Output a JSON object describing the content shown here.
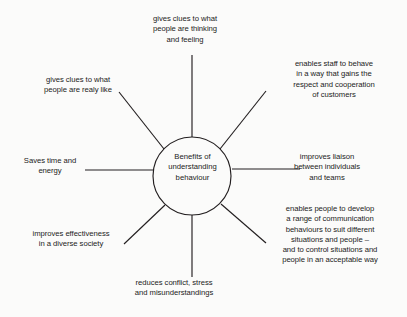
{
  "diagram": {
    "type": "mind-map",
    "title": "Benefits of understanding behaviour",
    "center": {
      "label": "Benefits of\nunderstanding\nbehaviour",
      "shape": "circle",
      "cx": 192,
      "cy": 176,
      "r": 39
    },
    "style": {
      "background_color": "#fbfbfa",
      "line_color": "#231f20",
      "text_color": "#1c1b1a"
    },
    "branches": [
      {
        "id": "top",
        "position": "top",
        "label": "gives clues to what\npeople are thinking\nand feeling",
        "spoke": {
          "x1": 192,
          "y1": 137,
          "x2": 192,
          "y2": 55
        }
      },
      {
        "id": "top-right",
        "position": "top-right",
        "label": "enables staff to behave\nin a way that gains the\nrespect and cooperation\nof customers",
        "spoke": {
          "x1": 220,
          "y1": 149,
          "x2": 266,
          "y2": 91
        }
      },
      {
        "id": "top-left",
        "position": "top-left",
        "label": "gives clues to what\npeople are realy like",
        "spoke": {
          "x1": 164,
          "y1": 149,
          "x2": 119,
          "y2": 92
        }
      },
      {
        "id": "left",
        "position": "left",
        "label": "Saves time and\nenergy",
        "spoke": {
          "x1": 153,
          "y1": 170,
          "x2": 85,
          "y2": 170
        }
      },
      {
        "id": "right",
        "position": "right",
        "label": "improves liaison\nbetween individuals\nand teams",
        "spoke": {
          "x1": 232,
          "y1": 169,
          "x2": 300,
          "y2": 169
        }
      },
      {
        "id": "bottom-right",
        "position": "bottom-right",
        "label": "enables people to develop\na range of communication\nbehaviours to suit different\nsituations and people –\nand to control situations and\npeople in an acceptable way",
        "spoke": {
          "x1": 221,
          "y1": 204,
          "x2": 266,
          "y2": 243
        }
      },
      {
        "id": "bottom",
        "position": "bottom",
        "label": "reduces conflict, stress\nand misunderstandings",
        "spoke": {
          "x1": 192,
          "y1": 215,
          "x2": 192,
          "y2": 277
        }
      },
      {
        "id": "bottom-left",
        "position": "bottom-left",
        "label": "improves effectiveness\nin a diverse society",
        "spoke": {
          "x1": 165,
          "y1": 205,
          "x2": 124,
          "y2": 244
        }
      }
    ]
  }
}
